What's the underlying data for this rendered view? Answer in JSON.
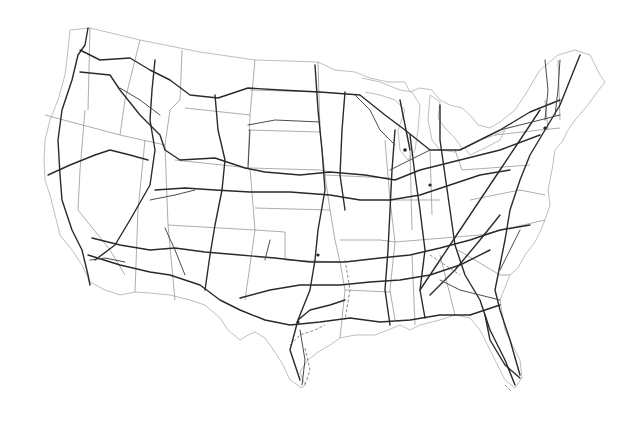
{
  "map": {
    "subject": "Contiguous United States interstate highway network",
    "background_color": "#ffffff",
    "colors": {
      "highway": "#2a2a2a",
      "state_border": "#8a8a8a",
      "coastline": "#b8b8b8"
    },
    "layers": [
      "coastline-outline",
      "state-borders",
      "interstate-highways"
    ],
    "labels": []
  }
}
